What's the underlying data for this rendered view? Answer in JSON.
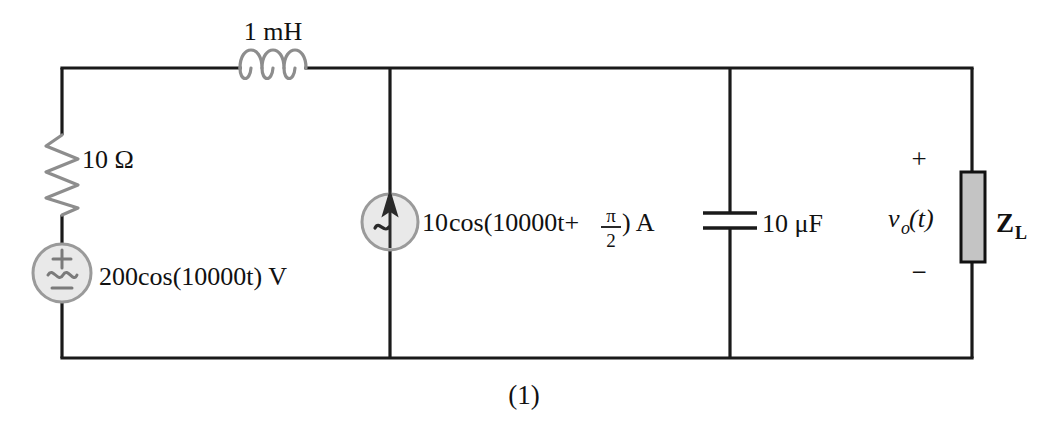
{
  "figure": {
    "caption": "(1)",
    "background_color": "#ffffff",
    "wire_color": "#1a1a1a",
    "component_gray": "#8d8d8d",
    "source_fill": "#e9e9e9",
    "load_fill": "#c4c4c4"
  },
  "components": {
    "inductor": {
      "name": "inductor",
      "label": "1 mH",
      "value": "1",
      "unit": "mH",
      "symbol": "coil",
      "loops": 3
    },
    "resistor": {
      "name": "resistor",
      "label": "10 Ω",
      "value": "10",
      "unit": "Ω",
      "symbol": "zigzag"
    },
    "voltage_source": {
      "name": "ac-voltage-source",
      "label": "200cos(10000t) V",
      "amplitude": "200",
      "expression": "200cos(10000t)",
      "unit": "V",
      "symbol": "circle-ac",
      "plus_sign": "+",
      "minus_sign": "−"
    },
    "current_source": {
      "name": "ac-current-source",
      "label_prefix": "10",
      "label_cos": "cos(10000t+",
      "frac_numerator": "π",
      "frac_denominator": "2",
      "label_suffix": ") A",
      "full_label": "10 cos(10000t+π/2) A",
      "unit": "A",
      "symbol": "circle-ac-arrow-up"
    },
    "capacitor": {
      "name": "capacitor",
      "label": "10 μF",
      "value": "10",
      "unit": "μF",
      "symbol": "parallel-plates"
    },
    "load": {
      "name": "load-impedance",
      "label_main": "Z",
      "label_sub": "L",
      "full_label": "ZL",
      "symbol": "gray-box"
    },
    "output_voltage": {
      "name": "output-voltage",
      "label_main": "v",
      "label_sub": "o",
      "label_rest": "(t)",
      "full_label": "vo(t)",
      "plus_sign": "+",
      "minus_sign": "−"
    }
  }
}
